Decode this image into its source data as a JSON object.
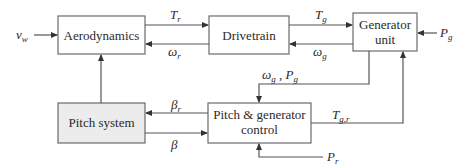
{
  "blocks": {
    "aerodynamics": "Aerodynamics",
    "drivetrain": "Drivetrain",
    "generator_line1": "Generator",
    "generator_line2": "unit",
    "pitch_system": "Pitch system",
    "control_line1": "Pitch & generator",
    "control_line2": "control"
  },
  "signals": {
    "vw": {
      "base": "v",
      "sub": "w"
    },
    "Tr": {
      "base": "T",
      "sub": "r"
    },
    "omega_r": {
      "base": "ω",
      "sub": "r"
    },
    "Tg": {
      "base": "T",
      "sub": "g"
    },
    "omega_g": {
      "base": "ω",
      "sub": "g"
    },
    "Pg": {
      "base": "P",
      "sub": "g"
    },
    "feedback": {
      "base1": "ω",
      "sub1": "g",
      "sep": " , ",
      "base2": "P",
      "sub2": "g"
    },
    "beta_r": {
      "base": "β",
      "sub": "r"
    },
    "beta": {
      "base": "β"
    },
    "Tgr": {
      "base": "T",
      "sub": "g,r"
    },
    "Pr": {
      "base": "P",
      "sub": "r"
    }
  },
  "colors": {
    "line": "#555555",
    "shaded_block": "#ececec"
  }
}
